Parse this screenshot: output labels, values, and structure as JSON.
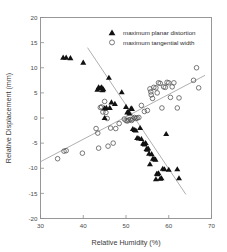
{
  "chart_data": {
    "type": "scatter",
    "title": "",
    "xlabel": "Relative Humidity  (%)",
    "ylabel": "Relative Displacement  (mm)",
    "xlim": [
      30,
      70
    ],
    "ylim": [
      -20,
      20
    ],
    "xticks": [
      30,
      40,
      50,
      60,
      70
    ],
    "yticks": [
      -20,
      -15,
      -10,
      -5,
      0,
      5,
      10,
      15,
      20
    ],
    "xtick_labels": [
      "30",
      "40",
      "50",
      "60",
      "70"
    ],
    "ytick_labels": [
      "-20",
      "-15",
      "-10",
      "-5",
      "0",
      "5",
      "10",
      "15",
      "20"
    ],
    "grid": false,
    "legend_position": "top-right",
    "series": [
      {
        "name": "maximum planar distortion",
        "marker": "filled-triangle",
        "color": "#111111",
        "points": [
          [
            35.3,
            12.1
          ],
          [
            36.0,
            12.1
          ],
          [
            37.0,
            12.0
          ],
          [
            40.0,
            11.1
          ],
          [
            43.3,
            5.7
          ],
          [
            43.6,
            6.2
          ],
          [
            44.0,
            6.0
          ],
          [
            44.3,
            6.2
          ],
          [
            44.5,
            5.6
          ],
          [
            44.7,
            5.8
          ],
          [
            45.0,
            2.0
          ],
          [
            45.0,
            0.1
          ],
          [
            45.4,
            2.1
          ],
          [
            46.0,
            8.1
          ],
          [
            46.2,
            2.1
          ],
          [
            46.6,
            3.2
          ],
          [
            47.4,
            2.9
          ],
          [
            49.0,
            5.2
          ],
          [
            50.0,
            2.3
          ],
          [
            50.3,
            1.2
          ],
          [
            50.5,
            1.3
          ],
          [
            50.8,
            1.0
          ],
          [
            51.2,
            2.0
          ],
          [
            51.4,
            1.9
          ],
          [
            51.6,
            -2.1
          ],
          [
            52.0,
            -2.3
          ],
          [
            52.3,
            -2.4
          ],
          [
            52.6,
            -3.9
          ],
          [
            53.0,
            -4.0
          ],
          [
            53.3,
            -1.9
          ],
          [
            53.6,
            -4.1
          ],
          [
            54.0,
            -5.0
          ],
          [
            54.2,
            -5.1
          ],
          [
            54.4,
            -5.2
          ],
          [
            54.6,
            -4.9
          ],
          [
            54.8,
            -6.1
          ],
          [
            55.0,
            -6.2
          ],
          [
            55.2,
            -6.0
          ],
          [
            55.4,
            -7.0
          ],
          [
            55.6,
            -9.1
          ],
          [
            56.0,
            -7.1
          ],
          [
            56.3,
            -8.0
          ],
          [
            56.6,
            -8.1
          ],
          [
            56.9,
            -8.2
          ],
          [
            57.0,
            -12.1
          ],
          [
            57.2,
            -11.0
          ],
          [
            57.4,
            -11.1
          ],
          [
            57.6,
            -10.9
          ],
          [
            58.0,
            -12.0
          ],
          [
            58.3,
            -11.9
          ],
          [
            58.6,
            -10.0
          ],
          [
            59.0,
            -10.1
          ],
          [
            59.4,
            -3.1
          ],
          [
            60.0,
            -10.2
          ],
          [
            62.0,
            -10.1
          ],
          [
            62.4,
            -11.9
          ]
        ]
      },
      {
        "name": "maximum tangential width",
        "marker": "open-circle",
        "color": "#4d4d4d",
        "points": [
          [
            34.0,
            -8.1
          ],
          [
            35.5,
            -6.6
          ],
          [
            36.0,
            -6.5
          ],
          [
            39.8,
            -7.0
          ],
          [
            43.0,
            -2.1
          ],
          [
            43.4,
            -3.0
          ],
          [
            43.6,
            -6.0
          ],
          [
            44.0,
            2.1
          ],
          [
            44.3,
            2.2
          ],
          [
            44.6,
            1.2
          ],
          [
            45.0,
            3.3
          ],
          [
            45.3,
            1.1
          ],
          [
            45.6,
            -0.1
          ],
          [
            45.8,
            -5.6
          ],
          [
            46.4,
            -2.0
          ],
          [
            47.0,
            -5.0
          ],
          [
            47.6,
            -2.1
          ],
          [
            48.4,
            -1.1
          ],
          [
            49.6,
            -0.2
          ],
          [
            50.0,
            -0.5
          ],
          [
            50.3,
            -0.6
          ],
          [
            50.6,
            -0.4
          ],
          [
            51.0,
            -0.3
          ],
          [
            51.3,
            -0.5
          ],
          [
            51.6,
            -0.2
          ],
          [
            52.0,
            0.1
          ],
          [
            52.3,
            -0.1
          ],
          [
            52.6,
            0.0
          ],
          [
            53.0,
            0.1
          ],
          [
            53.6,
            2.5
          ],
          [
            54.3,
            1.3
          ],
          [
            55.0,
            1.5
          ],
          [
            55.6,
            5.8
          ],
          [
            55.8,
            5.2
          ],
          [
            55.9,
            4.6
          ],
          [
            56.2,
            3.9
          ],
          [
            56.5,
            6.1
          ],
          [
            57.0,
            6.0
          ],
          [
            57.3,
            5.0
          ],
          [
            57.6,
            7.0
          ],
          [
            58.0,
            6.9
          ],
          [
            58.4,
            2.0
          ],
          [
            58.8,
            6.2
          ],
          [
            59.2,
            6.1
          ],
          [
            59.6,
            7.1
          ],
          [
            60.0,
            7.0
          ],
          [
            60.4,
            4.1
          ],
          [
            60.8,
            6.2
          ],
          [
            61.2,
            7.0
          ],
          [
            62.0,
            2.0
          ],
          [
            62.4,
            4.0
          ],
          [
            65.8,
            7.5
          ],
          [
            66.5,
            10.0
          ],
          [
            67.0,
            6.0
          ]
        ]
      }
    ],
    "trend_lines": [
      {
        "name": "planar-distortion-trend",
        "series": "maximum planar distortion",
        "x0": 41.0,
        "y0": 14.0,
        "x1": 64.0,
        "y1": -15.2
      },
      {
        "name": "tangential-width-trend",
        "series": "maximum tangential width",
        "x0": 30.0,
        "y0": -8.7,
        "x1": 68.5,
        "y1": 8.5
      }
    ]
  }
}
